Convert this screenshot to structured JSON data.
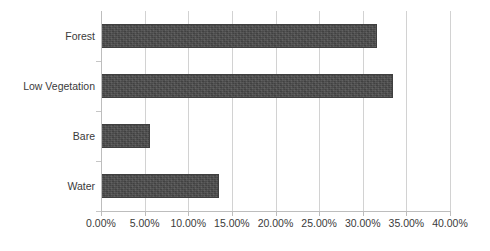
{
  "chart_data": {
    "type": "bar",
    "orientation": "horizontal",
    "title": "",
    "subtitle": "",
    "xlabel": "",
    "ylabel": "",
    "categories": [
      "Forest",
      "Low Vegetation",
      "Bare",
      "Water"
    ],
    "values": [
      31.6,
      33.5,
      5.6,
      13.5
    ],
    "value_format": "percent",
    "xlim": [
      0,
      40
    ],
    "xticks": [
      0,
      5,
      10,
      15,
      20,
      25,
      30,
      35,
      40
    ],
    "xtick_labels": [
      "0.00%",
      "5.00%",
      "10.00%",
      "15.00%",
      "20.00%",
      "25.00%",
      "30.00%",
      "35.00%",
      "40.00%"
    ],
    "grid": "vertical",
    "legend": "none",
    "series": [
      {
        "name": "Land Cover Proportion",
        "color": "#4a4a4a",
        "values": [
          31.6,
          33.5,
          5.6,
          13.5
        ]
      }
    ]
  },
  "axis": {
    "category_labels": [
      "Forest",
      "Low Vegetation",
      "Bare",
      "Water"
    ],
    "value_labels": [
      "0.00%",
      "5.00%",
      "10.00%",
      "15.00%",
      "20.00%",
      "25.00%",
      "30.00%",
      "35.00%",
      "40.00%"
    ]
  },
  "colors": {
    "bar_fill": "#4a4a4a",
    "gridline": "#d2d2d2",
    "axis_line": "#bdbdbd",
    "text": "#3a3a3a",
    "background": "#ffffff"
  }
}
